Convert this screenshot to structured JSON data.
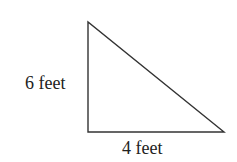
{
  "diagram": {
    "shape": "right-triangle",
    "stroke_color": "#333333",
    "vertices": {
      "top_left": [
        88,
        22
      ],
      "bottom_left": [
        88,
        132
      ],
      "bottom_right": [
        224,
        132
      ]
    },
    "labels": {
      "vertical_side": "6 feet",
      "horizontal_side": "4 feet"
    }
  }
}
